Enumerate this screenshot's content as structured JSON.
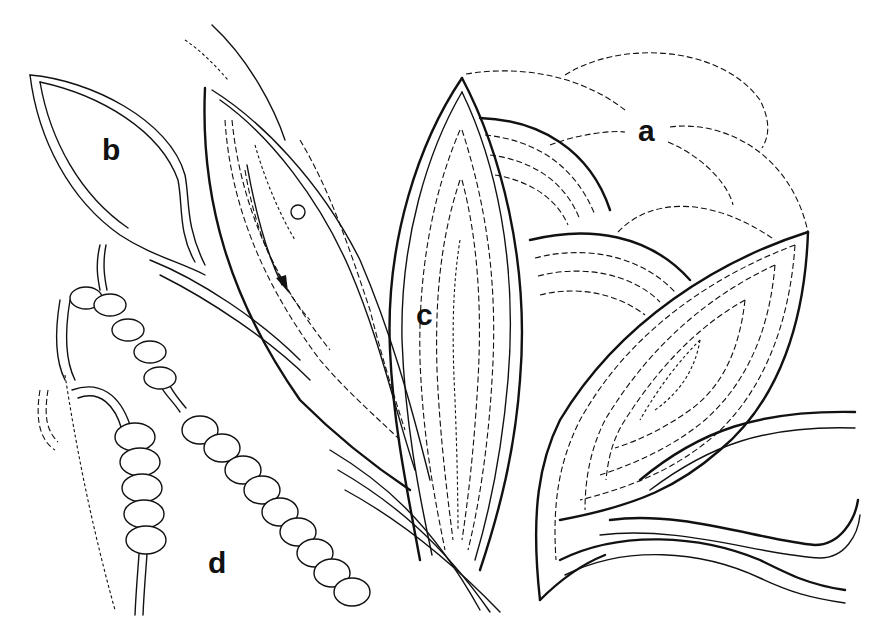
{
  "figure": {
    "background": "#ffffff",
    "ink": "#111111",
    "labels": [
      {
        "id": "a",
        "text": "a",
        "x": 638,
        "y": 116,
        "refers_to": "dashed petal outlines (unfilled, top right)"
      },
      {
        "id": "b",
        "text": "b",
        "x": 102,
        "y": 135,
        "refers_to": "outlined leaf shape (double contour, no fill)"
      },
      {
        "id": "c",
        "text": "c",
        "x": 416,
        "y": 300,
        "refers_to": "petal filled with concentric couched rows"
      },
      {
        "id": "d",
        "text": "d",
        "x": 208,
        "y": 548,
        "refers_to": "strings of beads"
      }
    ],
    "annotations": [
      {
        "type": "arrow",
        "direction": "down-right",
        "x": 280,
        "y": 285,
        "meaning": "direction of stitching"
      }
    ]
  }
}
